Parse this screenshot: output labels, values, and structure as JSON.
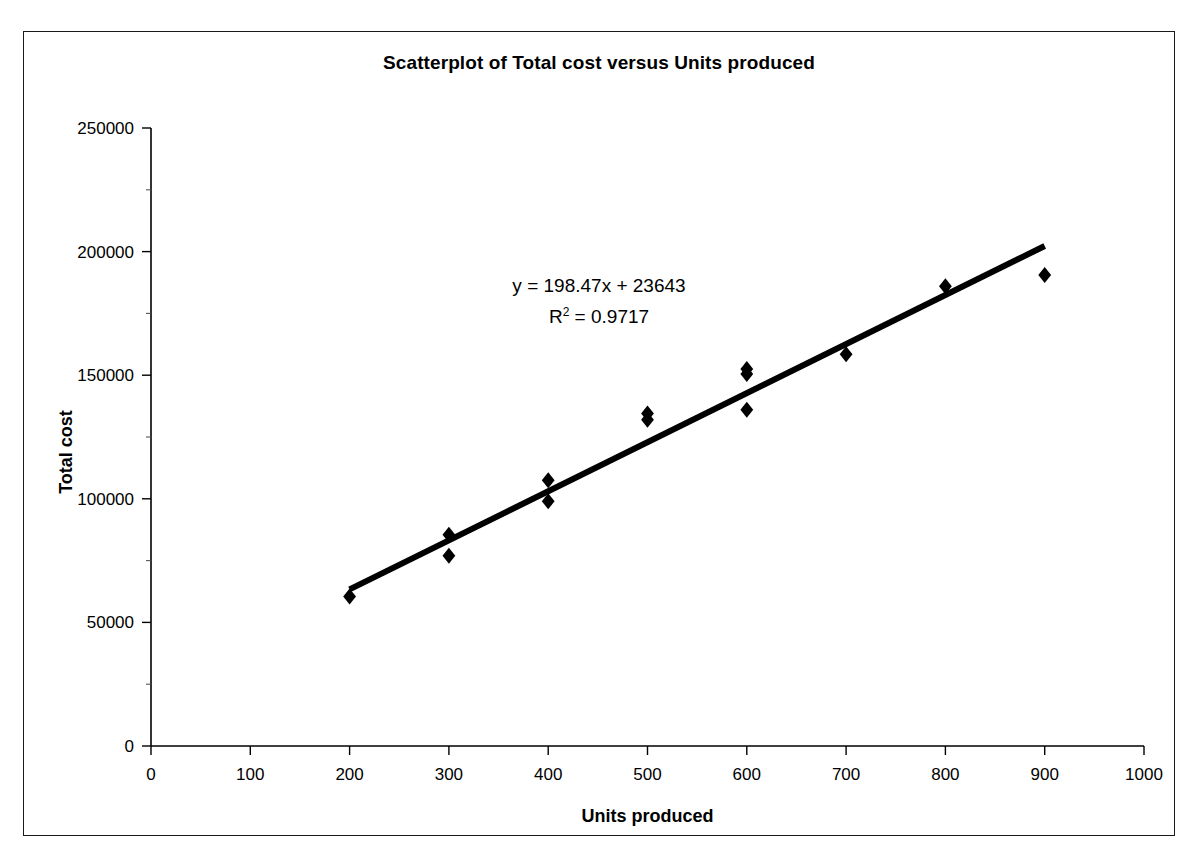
{
  "figure": {
    "title": "Scatterplot of Total cost versus Units produced",
    "frame_color": "#1a1a1a",
    "background": "#ffffff"
  },
  "chart_data": {
    "type": "scatter",
    "title": "Scatterplot of Total cost versus Units produced",
    "xlabel": "Units produced",
    "ylabel": "Total cost",
    "xlim": [
      0,
      1000
    ],
    "ylim": [
      0,
      250000
    ],
    "xticks": [
      0,
      100,
      200,
      300,
      400,
      500,
      600,
      700,
      800,
      900,
      1000
    ],
    "xtick_labels": [
      "0",
      "100",
      "200",
      "300",
      "400",
      "500",
      "600",
      "700",
      "800",
      "900",
      "1000"
    ],
    "yticks": [
      0,
      50000,
      100000,
      150000,
      200000,
      250000
    ],
    "ytick_labels": [
      "0",
      "50000",
      "100000",
      "150000",
      "200000",
      "250000"
    ],
    "grid": false,
    "legend": false,
    "marker": "diamond",
    "marker_color": "#000000",
    "points": [
      {
        "x": 200,
        "y": 60500
      },
      {
        "x": 300,
        "y": 85500
      },
      {
        "x": 300,
        "y": 77000
      },
      {
        "x": 400,
        "y": 107500
      },
      {
        "x": 400,
        "y": 99000
      },
      {
        "x": 500,
        "y": 134500
      },
      {
        "x": 500,
        "y": 132000
      },
      {
        "x": 600,
        "y": 152500
      },
      {
        "x": 600,
        "y": 150500
      },
      {
        "x": 600,
        "y": 136000
      },
      {
        "x": 700,
        "y": 158500
      },
      {
        "x": 800,
        "y": 186000
      },
      {
        "x": 900,
        "y": 190500
      }
    ],
    "trendline": {
      "slope": 198.47,
      "intercept": 23643,
      "x_start": 200,
      "x_end": 900,
      "color": "#000000",
      "width": 6
    },
    "annotations": {
      "equation": "y = 198.47x + 23643",
      "r_squared_prefix": "R",
      "r_squared_sup": "2",
      "r_squared_value": " = 0.9717"
    }
  }
}
